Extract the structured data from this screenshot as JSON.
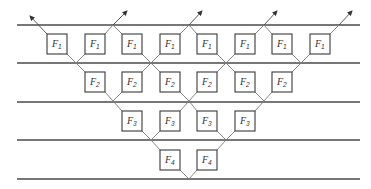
{
  "diagram": {
    "type": "butterfly-network",
    "stages": [
      {
        "label_base": "F",
        "label_sub": "1",
        "count": 8
      },
      {
        "label_base": "F",
        "label_sub": "2",
        "count": 6
      },
      {
        "label_base": "F",
        "label_sub": "3",
        "count": 4
      },
      {
        "label_base": "F",
        "label_sub": "4",
        "count": 2
      }
    ],
    "labels": {
      "f1": {
        "base": "F",
        "sub": "1"
      },
      "f2": {
        "base": "F",
        "sub": "2"
      },
      "f3": {
        "base": "F",
        "sub": "3"
      },
      "f4": {
        "base": "F",
        "sub": "4"
      }
    },
    "horizontal_lines": 5,
    "output_arrows": 5,
    "colors": {
      "line": "#4a4a4a",
      "box_stroke": "#3a3a3a",
      "background": "#ffffff"
    }
  }
}
